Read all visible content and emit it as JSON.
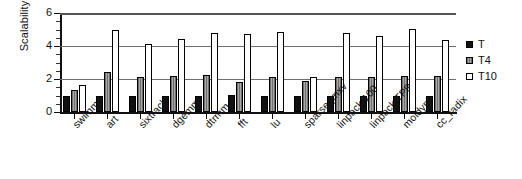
{
  "chart_data": {
    "type": "bar",
    "title": "",
    "xlabel": "",
    "ylabel": "Scalability",
    "ylim": [
      0,
      6
    ],
    "yticks": [
      0,
      2,
      4,
      6
    ],
    "grid": true,
    "legend_position": "right",
    "categories": [
      "swimm",
      "art",
      "sixtrack",
      "dgemm",
      "dtrmm",
      "fft",
      "lu",
      "sparse_mxv",
      "linpack 100",
      "linpack TPP",
      "moldyn",
      "cc_radix"
    ],
    "series": [
      {
        "name": "T",
        "color": "#111111",
        "values": [
          1.0,
          1.0,
          1.0,
          1.0,
          1.0,
          1.05,
          1.0,
          1.0,
          1.0,
          1.0,
          1.0,
          1.0
        ]
      },
      {
        "name": "T4",
        "color": "#8a8a8a",
        "values": [
          1.35,
          2.45,
          2.1,
          2.2,
          2.25,
          1.8,
          2.1,
          1.85,
          2.15,
          2.15,
          2.2,
          2.2
        ]
      },
      {
        "name": "T10",
        "color": "#ffffff",
        "values": [
          1.65,
          5.0,
          4.1,
          4.45,
          4.8,
          4.75,
          4.85,
          2.15,
          4.8,
          4.6,
          5.05,
          4.35
        ]
      }
    ]
  },
  "axis": {
    "y_title": "Scalability",
    "tick_labels": [
      "6",
      "4",
      "2",
      "0"
    ]
  },
  "legend": {
    "items": [
      {
        "label": "T",
        "swatch": "t"
      },
      {
        "label": "T4",
        "swatch": "t4"
      },
      {
        "label": "T10",
        "swatch": "t10"
      }
    ]
  }
}
